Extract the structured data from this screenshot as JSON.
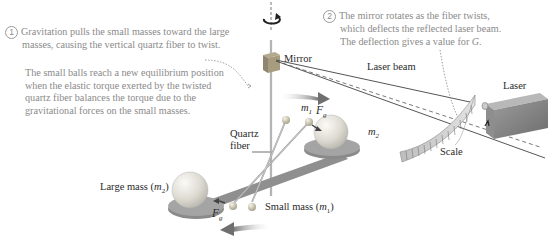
{
  "notes": {
    "step1": {
      "number": "1",
      "lines": [
        "Gravitation pulls the small masses toward the large",
        "masses, causing the vertical quartz fiber to twist."
      ]
    },
    "equilibrium": {
      "lines": [
        "The small balls reach a new equilibrium position",
        "when the elastic torque exerted by the twisted",
        "quartz fiber balances the torque due to the",
        "gravitational forces on the small masses."
      ]
    },
    "step2": {
      "number": "2",
      "lines": [
        "The mirror rotates as the fiber twists,",
        "which deflects the reflected laser beam.",
        "The deflection gives a value for "
      ],
      "symbol": "G."
    }
  },
  "labels": {
    "mirror": "Mirror",
    "laser_beam": "Laser beam",
    "laser": "Laser",
    "scale": "Scale",
    "quartz": "Quartz",
    "fiber": "fiber",
    "large_mass": "Large mass (",
    "large_mass_sym": "m",
    "large_mass_sub": "2",
    "close_paren": ")",
    "small_mass": "Small mass (",
    "small_mass_sym": "m",
    "small_mass_sub": "1",
    "m1_sym": "m",
    "m1_sub": "1",
    "m2_sym": "m",
    "m2_sub": "2",
    "fg_sym": "F",
    "fg_sub": "g"
  },
  "icons": {
    "rotation": "rotation-arrow-icon",
    "force_arrow": "force-arrow-icon"
  },
  "colors": {
    "note_text": "#8a8a8a",
    "label_text": "#2a2a2a",
    "sphere": "#e8e6e0",
    "platform": "#8f8f8f",
    "arrow": "#777777",
    "laser_body": "#8a8a8a"
  }
}
